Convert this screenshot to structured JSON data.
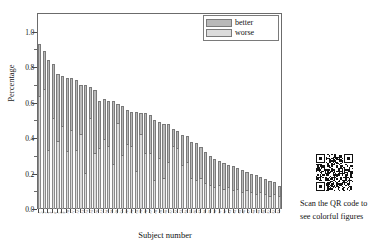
{
  "figure": {
    "y_axis": {
      "title": "Percentage",
      "ticks": [
        "0.0",
        "0.2",
        "0.4",
        "0.6",
        "0.8",
        "1.0"
      ]
    },
    "x_axis": {
      "title": "Subject number"
    },
    "legend": {
      "items": [
        {
          "label": "better",
          "color": "#b9b9b9"
        },
        {
          "label": "worse",
          "color": "#dcdcdc"
        }
      ]
    },
    "qr": {
      "icon": "qr-code-icon",
      "caption_line1": "Scan the QR code to",
      "caption_line2": "see colorful figures"
    }
  },
  "chart_data": {
    "type": "bar",
    "title": "",
    "xlabel": "Subject number",
    "ylabel": "Percentage",
    "ylim": [
      0.0,
      1.1
    ],
    "grid": false,
    "stacked": true,
    "legend_position": "top-right",
    "categories": [
      "1",
      "2",
      "3",
      "4",
      "5",
      "6",
      "7",
      "8",
      "9",
      "10",
      "11",
      "12",
      "13",
      "14",
      "15",
      "16",
      "17",
      "18",
      "19",
      "20",
      "21",
      "22",
      "23",
      "24",
      "25",
      "26",
      "27",
      "28",
      "29",
      "30",
      "31",
      "32",
      "33",
      "34",
      "35",
      "36",
      "37",
      "38",
      "39",
      "40",
      "41",
      "42",
      "43",
      "44",
      "45",
      "46",
      "47",
      "48",
      "49",
      "50",
      "51",
      "52",
      "53"
    ],
    "series": [
      {
        "name": "worse",
        "color": "#dcdcdc",
        "values": [
          0.63,
          0.67,
          0.33,
          0.51,
          0.38,
          0.46,
          0.32,
          0.44,
          0.33,
          0.42,
          0.2,
          0.51,
          0.31,
          0.34,
          0.39,
          0.35,
          0.25,
          0.48,
          0.3,
          0.36,
          0.35,
          0.21,
          0.42,
          0.31,
          0.31,
          0.16,
          0.28,
          0.17,
          0.26,
          0.35,
          0.34,
          0.24,
          0.26,
          0.17,
          0.16,
          0.17,
          0.14,
          0.13,
          0.12,
          0.13,
          0.11,
          0.12,
          0.1,
          0.11,
          0.09,
          0.1,
          0.09,
          0.08,
          0.09,
          0.08,
          0.07,
          0.08,
          0.07
        ]
      },
      {
        "name": "better",
        "color": "#b9b9b9",
        "values": [
          0.3,
          0.22,
          0.51,
          0.31,
          0.38,
          0.29,
          0.42,
          0.3,
          0.4,
          0.28,
          0.5,
          0.18,
          0.36,
          0.27,
          0.23,
          0.26,
          0.36,
          0.11,
          0.28,
          0.2,
          0.2,
          0.34,
          0.12,
          0.23,
          0.22,
          0.34,
          0.21,
          0.31,
          0.22,
          0.1,
          0.1,
          0.18,
          0.15,
          0.21,
          0.21,
          0.18,
          0.18,
          0.17,
          0.16,
          0.14,
          0.15,
          0.13,
          0.14,
          0.12,
          0.13,
          0.11,
          0.11,
          0.11,
          0.09,
          0.09,
          0.09,
          0.07,
          0.06
        ]
      }
    ],
    "totals": [
      0.93,
      0.89,
      0.84,
      0.82,
      0.76,
      0.75,
      0.74,
      0.74,
      0.73,
      0.7,
      0.7,
      0.69,
      0.67,
      0.61,
      0.62,
      0.61,
      0.61,
      0.59,
      0.58,
      0.56,
      0.55,
      0.55,
      0.54,
      0.54,
      0.53,
      0.5,
      0.49,
      0.48,
      0.48,
      0.45,
      0.44,
      0.42,
      0.41,
      0.38,
      0.37,
      0.35,
      0.32,
      0.3,
      0.28,
      0.27,
      0.26,
      0.25,
      0.24,
      0.23,
      0.22,
      0.21,
      0.2,
      0.19,
      0.18,
      0.17,
      0.16,
      0.15,
      0.13
    ]
  }
}
